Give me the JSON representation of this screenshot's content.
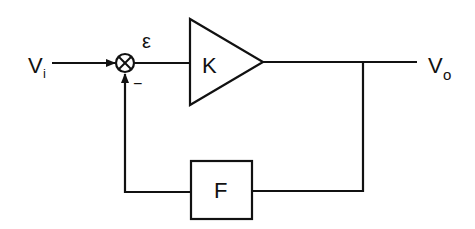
{
  "diagram": {
    "type": "feedback-block-diagram",
    "input_label": "V",
    "input_subscript": "i",
    "output_label": "V",
    "output_subscript": "o",
    "error_label": "ε",
    "minus_sign": "−",
    "forward_block": {
      "label": "K",
      "shape": "triangle-amplifier"
    },
    "feedback_block": {
      "label": "F",
      "shape": "rectangle"
    },
    "summing_junction": {
      "symbol": "circle-x"
    },
    "colors": {
      "stroke": "#111111",
      "background": "#ffffff"
    }
  }
}
